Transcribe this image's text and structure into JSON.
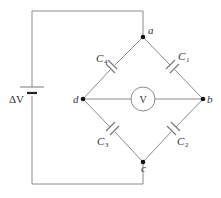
{
  "diagram": {
    "source": {
      "label": "ΔV",
      "type": "battery"
    },
    "nodes": [
      {
        "id": "a",
        "label": "a"
      },
      {
        "id": "b",
        "label": "b"
      },
      {
        "id": "c",
        "label": "c"
      },
      {
        "id": "d",
        "label": "d"
      }
    ],
    "capacitors": [
      {
        "id": "C1",
        "letter": "C",
        "sub": "1",
        "between": [
          "a",
          "b"
        ]
      },
      {
        "id": "C2",
        "letter": "C",
        "sub": "2",
        "between": [
          "b",
          "c"
        ]
      },
      {
        "id": "C3",
        "letter": "C",
        "sub": "3",
        "between": [
          "c",
          "d"
        ]
      },
      {
        "id": "C4",
        "letter": "C",
        "sub": "4",
        "between": [
          "d",
          "a"
        ]
      }
    ],
    "voltmeter": {
      "label": "V",
      "between": [
        "d",
        "b"
      ]
    },
    "colors": {
      "wire": "#8a8a8a",
      "node": "#111111",
      "text": "#333333"
    }
  }
}
